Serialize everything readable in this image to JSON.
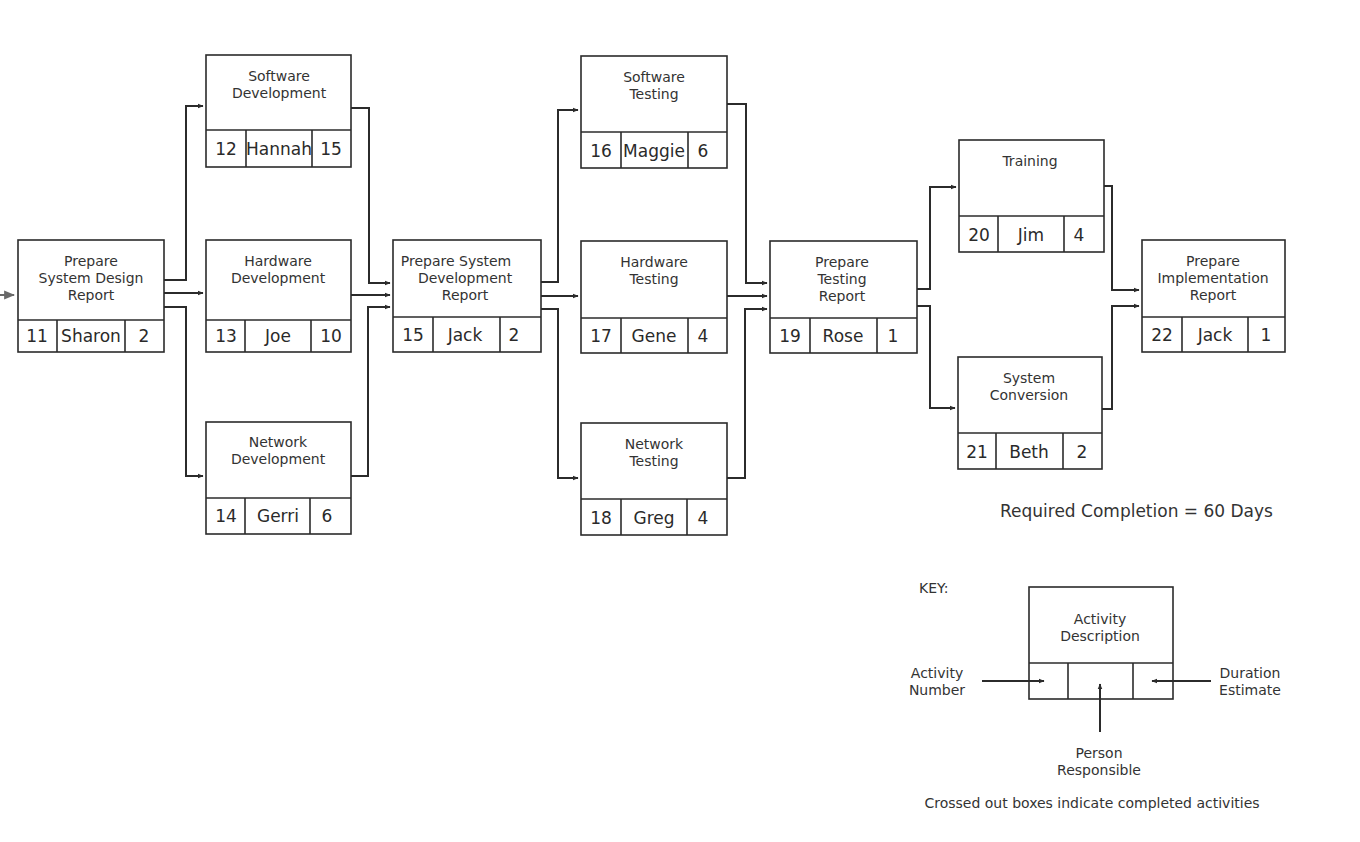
{
  "diagram": {
    "type": "project network diagram",
    "activities": [
      {
        "id": "11",
        "description": [
          "Prepare",
          "System Design",
          "Report"
        ],
        "number": "11",
        "person": "Sharon",
        "duration": "2"
      },
      {
        "id": "12",
        "description": [
          "Software",
          "Development"
        ],
        "number": "12",
        "person": "Hannah",
        "duration": "15"
      },
      {
        "id": "13",
        "description": [
          "Hardware",
          "Development"
        ],
        "number": "13",
        "person": "Joe",
        "duration": "10"
      },
      {
        "id": "14",
        "description": [
          "Network",
          "Development"
        ],
        "number": "14",
        "person": "Gerri",
        "duration": "6"
      },
      {
        "id": "15",
        "description": [
          "Prepare System",
          "Development",
          "Report"
        ],
        "number": "15",
        "person": "Jack",
        "duration": "2"
      },
      {
        "id": "16",
        "description": [
          "Software",
          "Testing"
        ],
        "number": "16",
        "person": "Maggie",
        "duration": "6"
      },
      {
        "id": "17",
        "description": [
          "Hardware",
          "Testing"
        ],
        "number": "17",
        "person": "Gene",
        "duration": "4"
      },
      {
        "id": "18",
        "description": [
          "Network",
          "Testing"
        ],
        "number": "18",
        "person": "Greg",
        "duration": "4"
      },
      {
        "id": "19",
        "description": [
          "Prepare",
          "Testing",
          "Report"
        ],
        "number": "19",
        "person": "Rose",
        "duration": "1"
      },
      {
        "id": "20",
        "description": [
          "Training"
        ],
        "number": "20",
        "person": "Jim",
        "duration": "4"
      },
      {
        "id": "21",
        "description": [
          "System",
          "Conversion"
        ],
        "number": "21",
        "person": "Beth",
        "duration": "2"
      },
      {
        "id": "22",
        "description": [
          "Prepare",
          "Implementation",
          "Report"
        ],
        "number": "22",
        "person": "Jack",
        "duration": "1"
      }
    ],
    "edges": [
      [
        "11",
        "12"
      ],
      [
        "11",
        "13"
      ],
      [
        "11",
        "14"
      ],
      [
        "12",
        "15"
      ],
      [
        "13",
        "15"
      ],
      [
        "14",
        "15"
      ],
      [
        "15",
        "16"
      ],
      [
        "15",
        "17"
      ],
      [
        "15",
        "18"
      ],
      [
        "16",
        "19"
      ],
      [
        "17",
        "19"
      ],
      [
        "18",
        "19"
      ],
      [
        "19",
        "20"
      ],
      [
        "19",
        "21"
      ],
      [
        "20",
        "22"
      ],
      [
        "21",
        "22"
      ]
    ],
    "required_completion": "Required Completion = 60 Days"
  },
  "key": {
    "title": "KEY:",
    "description": [
      "Activity",
      "Description"
    ],
    "activity_number": [
      "Activity",
      "Number"
    ],
    "duration_estimate": [
      "Duration",
      "Estimate"
    ],
    "person_responsible": [
      "Person",
      "Responsible"
    ],
    "footnote": "Crossed out boxes indicate completed activities"
  },
  "colors": {
    "line": "#2b2b2b",
    "text": "#333333",
    "background": "#ffffff"
  }
}
